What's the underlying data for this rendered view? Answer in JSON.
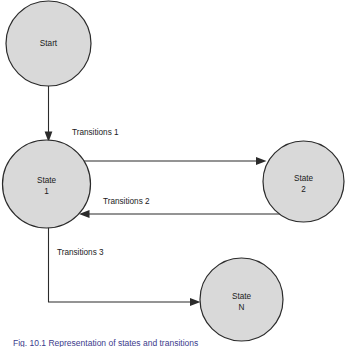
{
  "figure": {
    "type": "state-transition-diagram",
    "background_color": "#ffffff",
    "node_fill_color": "#d9d9d9",
    "node_stroke_color": "#2b2b2b",
    "text_color": "#1a1a1a",
    "caption": "Fig. 10.1 Representation of states and transitions"
  },
  "nodes": [
    {
      "id": "start",
      "label_line1": "Start",
      "label_line2": "",
      "cx": 48.5,
      "cy": 43.5,
      "r": 42.5
    },
    {
      "id": "state1",
      "label_line1": "State",
      "label_line2": "1",
      "cx": 46.5,
      "cy": 184.0,
      "r": 44.0
    },
    {
      "id": "state2",
      "label_line1": "State",
      "label_line2": "2",
      "cx": 303.5,
      "cy": 181.5,
      "r": 40.5
    },
    {
      "id": "stateN",
      "label_line1": "State",
      "label_line2": "N",
      "cx": 241.5,
      "cy": 299.5,
      "r": 41.5
    }
  ],
  "edges": [
    {
      "id": "start-to-state1",
      "label": "",
      "from": "start",
      "to": "state1"
    },
    {
      "id": "transitions-1",
      "label": "Transitions 1",
      "label_x": 72,
      "label_y": 133,
      "from": "state1",
      "to": "state2"
    },
    {
      "id": "transitions-2",
      "label": "Transitions 2",
      "label_x": 103,
      "label_y": 202,
      "from": "state2",
      "to": "state1"
    },
    {
      "id": "transitions-3",
      "label": "Transitions 3",
      "label_x": 57,
      "label_y": 253,
      "from": "state1",
      "to": "stateN"
    }
  ]
}
